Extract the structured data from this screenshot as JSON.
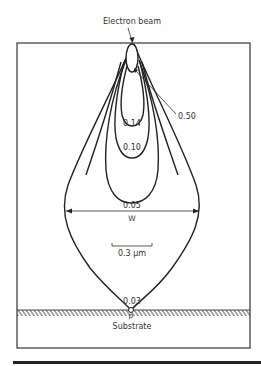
{
  "figure": {
    "beam_label": "Electron beam",
    "substrate_label": "Substrate",
    "point_label": "p",
    "width_label": "W",
    "scale_bar_label": "0.3 μm",
    "contours": [
      {
        "value": "0.50",
        "label": "0.50"
      },
      {
        "value": "0.14",
        "label": "0.14"
      },
      {
        "value": "0.10",
        "label": "0.10"
      },
      {
        "value": "0.05",
        "label": "0.05"
      },
      {
        "value": "0.03",
        "label": "0.03"
      }
    ]
  }
}
